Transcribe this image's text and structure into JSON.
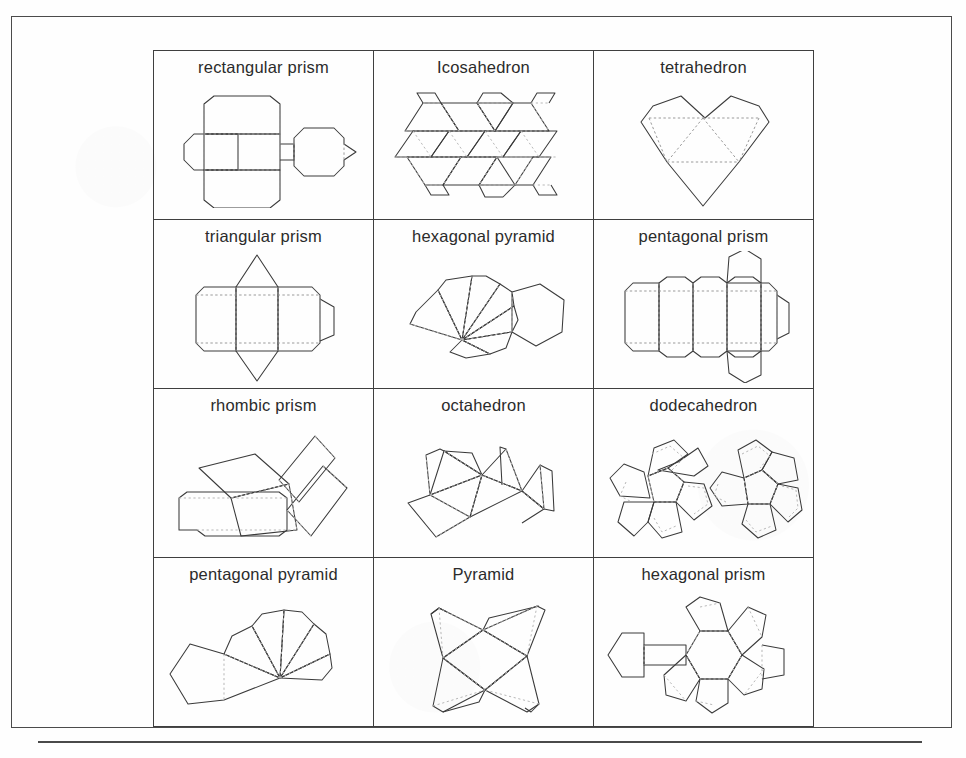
{
  "page": {
    "background_color": "#fefefe",
    "frame_color": "#4b4b4b",
    "line_color": "#3a3a3a",
    "fold_line_color": "#9a9a9a"
  },
  "table": {
    "rows": 4,
    "columns": 3,
    "cells": [
      {
        "label": "rectangular prism",
        "net": "rectangular-prism"
      },
      {
        "label": "Icosahedron",
        "net": "icosahedron"
      },
      {
        "label": "tetrahedron",
        "net": "tetrahedron"
      },
      {
        "label": "triangular prism",
        "net": "triangular-prism"
      },
      {
        "label": "hexagonal pyramid",
        "net": "hexagonal-pyramid"
      },
      {
        "label": "pentagonal prism",
        "net": "pentagonal-prism"
      },
      {
        "label": "rhombic prism",
        "net": "rhombic-prism"
      },
      {
        "label": "octahedron",
        "net": "octahedron"
      },
      {
        "label": "dodecahedron",
        "net": "dodecahedron"
      },
      {
        "label": "pentagonal pyramid",
        "net": "pentagonal-pyramid"
      },
      {
        "label": "Pyramid",
        "net": "pyramid"
      },
      {
        "label": "hexagonal prism",
        "net": "hexagonal-prism"
      }
    ]
  },
  "footer": {
    "rule": true
  }
}
